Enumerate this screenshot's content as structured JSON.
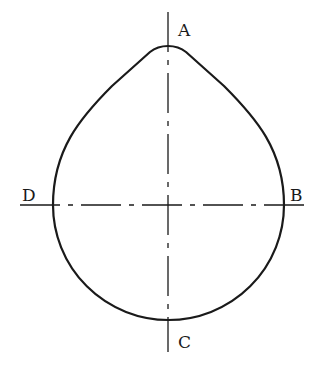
{
  "figure": {
    "labels": {
      "top": "A",
      "right": "B",
      "bottom": "C",
      "left": "D"
    },
    "colors": {
      "stroke": "#1a1a1a",
      "background": "#ffffff"
    }
  }
}
